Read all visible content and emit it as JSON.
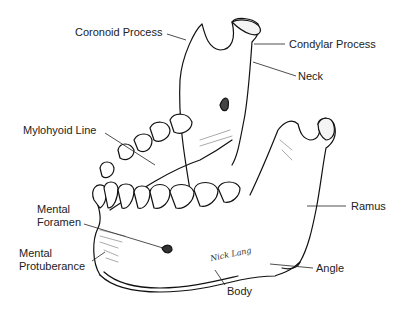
{
  "diagram": {
    "signature": "Nick Lang",
    "labels": {
      "coronoid_process": "Coronoid Process",
      "condylar_process": "Condylar Process",
      "neck": "Neck",
      "mylohyoid_line": "Mylohyoid Line",
      "ramus": "Ramus",
      "mental_foramen_1": "Mental",
      "mental_foramen_2": "Foramen",
      "mental_protuberance_1": "Mental",
      "mental_protuberance_2": "Protuberance",
      "angle": "Angle",
      "body": "Body"
    }
  }
}
